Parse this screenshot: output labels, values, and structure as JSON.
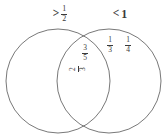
{
  "diagram": {
    "type": "venn-two-set",
    "stroke_color": "#555555",
    "text_color": "#3a3a3a",
    "background": "#ffffff",
    "left_set": {
      "label_operator": ">",
      "label_value_numerator": "1",
      "label_value_denominator": "2",
      "items": []
    },
    "right_set": {
      "label_operator": "<",
      "label_value": "1",
      "items": [
        {
          "numerator": "1",
          "denominator": "3"
        },
        {
          "numerator": "1",
          "denominator": "4"
        }
      ]
    },
    "overlap": {
      "items": [
        {
          "numerator": "3",
          "denominator": "5"
        },
        {
          "numerator": "2",
          "denominator": "3"
        }
      ]
    }
  }
}
